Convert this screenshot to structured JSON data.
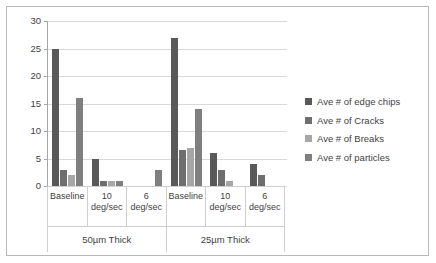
{
  "chart_data": {
    "type": "bar",
    "title": "",
    "subtitle": "",
    "xlabel": "",
    "ylabel": "",
    "ylim": [
      0,
      30
    ],
    "ytick_step": 5,
    "yticks": [
      "0",
      "5",
      "10",
      "15",
      "20",
      "25",
      "30"
    ],
    "grid": true,
    "legend_position": "right",
    "categories": [
      "Baseline",
      "10 deg/sec",
      "6 deg/sec",
      "Baseline",
      "10 deg/sec",
      "6 deg/sec"
    ],
    "category_lines": [
      [
        "Baseline",
        ""
      ],
      [
        "10",
        "deg/sec"
      ],
      [
        "6",
        "deg/sec"
      ],
      [
        "Baseline",
        ""
      ],
      [
        "10",
        "deg/sec"
      ],
      [
        "6",
        "deg/sec"
      ]
    ],
    "groups": [
      {
        "label": "50µm Thick",
        "span": 3
      },
      {
        "label": "25µm Thick",
        "span": 3
      }
    ],
    "series": [
      {
        "name": "Ave # of edge chips",
        "color": "#595959",
        "values": [
          25,
          5,
          0,
          27,
          6,
          4
        ]
      },
      {
        "name": "Ave # of Cracks",
        "color": "#6e6e6e",
        "values": [
          3,
          1,
          0,
          6.5,
          3,
          2
        ]
      },
      {
        "name": "Ave # of Breaks",
        "color": "#a6a6a6",
        "values": [
          2,
          1,
          0,
          7,
          1,
          0
        ]
      },
      {
        "name": "Ave # of particles",
        "color": "#7f7f7f",
        "values": [
          16,
          1,
          3,
          14,
          0,
          0
        ]
      }
    ]
  },
  "colors": {
    "frame": "#b8b8b8",
    "gridline": "#d9d9d9",
    "axis": "#a6a6a6",
    "text": "#3f3f3f",
    "background": "#ffffff"
  }
}
